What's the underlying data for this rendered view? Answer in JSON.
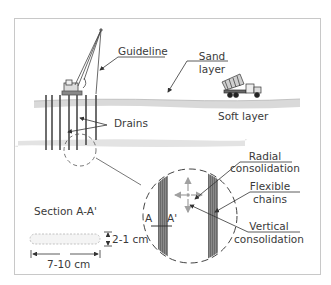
{
  "diagram": {
    "type": "engineering-illustration",
    "colors": {
      "frame": "#c8c8c8",
      "line": "#333333",
      "ground": "#d9d9d9",
      "drain_fill": "#7a7a7a",
      "arrow_gray": "#a0a0a0",
      "text": "#3a3a3a"
    },
    "labels": {
      "guideline": "Guideline",
      "sand_layer_1": "Sand",
      "sand_layer_2": "layer",
      "drains": "Drains",
      "soft_layer": "Soft layer",
      "radial_1": "Radial",
      "radial_2": "consolidation",
      "flexible_1": "Flexible",
      "flexible_2": "chains",
      "vertical_1": "Vertical",
      "vertical_2": "consolidation",
      "section": "Section A-A'",
      "section_a": "A",
      "section_a_prime": "A'",
      "thickness": "2-1 cm",
      "width": "7-10 cm"
    },
    "elements": [
      {
        "id": "crane-rig",
        "kind": "machine"
      },
      {
        "id": "dump-truck",
        "kind": "machine"
      },
      {
        "id": "drains",
        "count": 7
      },
      {
        "id": "detail-circle",
        "kind": "magnified-view"
      },
      {
        "id": "drain-cross-section",
        "kind": "section"
      }
    ]
  }
}
